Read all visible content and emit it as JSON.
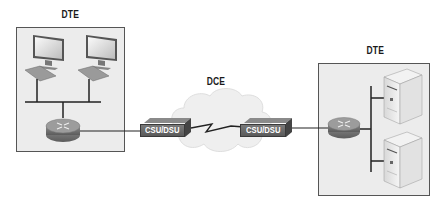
{
  "diagram": {
    "left_site": {
      "label": "DTE",
      "devices": [
        "workstation",
        "workstation",
        "router"
      ]
    },
    "wan": {
      "label": "DCE",
      "devices": [
        "CSU/DSU",
        "serial-link",
        "CSU/DSU"
      ]
    },
    "right_site": {
      "label": "DTE",
      "devices": [
        "router",
        "server",
        "server"
      ]
    },
    "csu_left_label": "CSU/DSU",
    "csu_right_label": "CSU/DSU"
  },
  "colors": {
    "zone_fill": "#ececec",
    "zone_border": "#555555",
    "csu_fill": "#666666",
    "cloud_fill": "#efefef",
    "line": "#222222"
  }
}
